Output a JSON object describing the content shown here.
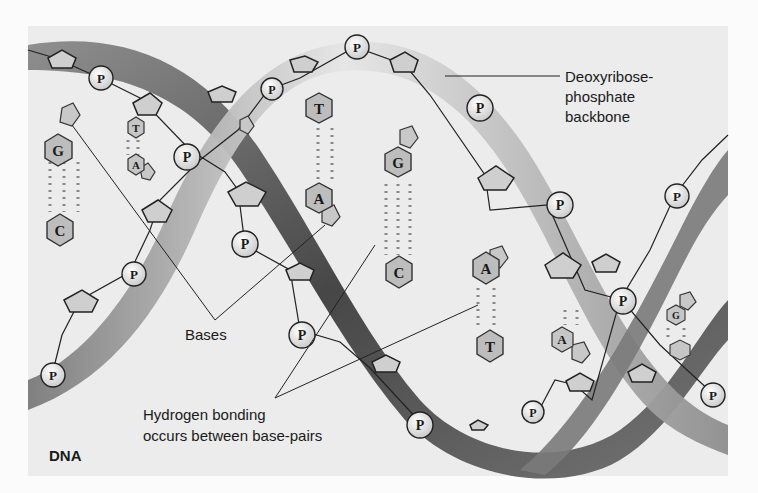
{
  "figure": {
    "title": "DNA",
    "background": "#fbfbfb",
    "panel_color": "#ececec",
    "strand_dark": "#5a5a5a",
    "strand_light": "#c9c9c9"
  },
  "labels": {
    "backbone_line1": "Deoxyribose-",
    "backbone_line2": "phosphate",
    "backbone_line3": "backbone",
    "bases": "Bases",
    "hbond_line1": "Hydrogen bonding",
    "hbond_line2": "occurs between base-pairs"
  },
  "phosphate_symbol": "P",
  "base_pairs": [
    {
      "top": "G",
      "bottom": "C"
    },
    {
      "top": "T",
      "bottom": "A"
    },
    {
      "top": "T",
      "bottom": "A"
    },
    {
      "top": "G",
      "bottom": "C"
    },
    {
      "top": "A",
      "bottom": "T"
    },
    {
      "top": "A",
      "bottom": ""
    },
    {
      "top": "G",
      "bottom": ""
    }
  ]
}
